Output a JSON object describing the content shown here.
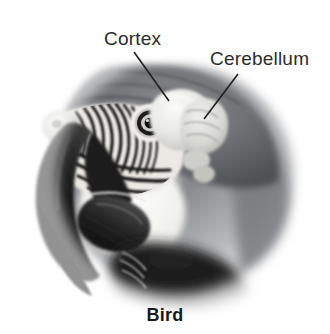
{
  "figure": {
    "caption": "Bird",
    "style": "grayscale-photographic-illustration",
    "background_color": "#ffffff",
    "width": 330,
    "height": 334
  },
  "labels": [
    {
      "id": "cortex",
      "text": "Cortex",
      "color": "#2b2b2b",
      "text_x": 104,
      "text_y": 28,
      "leader_line": {
        "x1": 134,
        "y1": 52,
        "x2": 169,
        "y2": 101,
        "color": "#1f1f1f",
        "width": 1.6
      }
    },
    {
      "id": "cerebellum",
      "text": "Cerebellum",
      "color": "#2b2b2b",
      "text_x": 210,
      "text_y": 48,
      "leader_line": {
        "x1": 238,
        "y1": 74,
        "x2": 204,
        "y2": 119,
        "color": "#1f1f1f",
        "width": 1.6
      }
    }
  ],
  "anatomy": {
    "parts": [
      {
        "name": "crown-feathers",
        "tone": "#6f7074"
      },
      {
        "name": "nape-feathers",
        "tone": "#8d8f93"
      },
      {
        "name": "facial-stripe-feathers",
        "tone": "#1c1c1c"
      },
      {
        "name": "white-cheek-patch",
        "tone": "#f6f6f4"
      },
      {
        "name": "eye",
        "tone": "#0d0d0d"
      },
      {
        "name": "upper-mandible",
        "tone": "#141414"
      },
      {
        "name": "lower-mandible",
        "tone": "#2a2a2a"
      },
      {
        "name": "cere",
        "tone": "#d8d8d6"
      },
      {
        "name": "cortex-lobe",
        "tone": "#e8e8e4"
      },
      {
        "name": "cerebellum-lobe",
        "tone": "#dcdcd8"
      },
      {
        "name": "throat-feathers",
        "tone": "#1b1b1b"
      },
      {
        "name": "neck-band",
        "tone": "#eceae6"
      }
    ],
    "palette": {
      "ink": "#1f1f1f",
      "mid_gray": "#7e8084",
      "light_gray": "#d5d5d2",
      "highlight": "#f7f7f5",
      "background": "#ffffff"
    }
  }
}
